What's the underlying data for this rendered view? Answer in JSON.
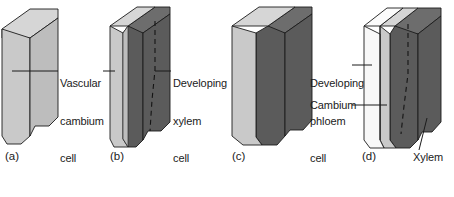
{
  "figure": {
    "background_color": "#ffffff",
    "panels": [
      {
        "id": "a",
        "caption": "(a)",
        "slabs": [
          {
            "name": "vascular-cambium-cell",
            "fill": "#c9c9c9",
            "top_fill": "#d6d6d6",
            "side_fill": "#bdbdbd"
          }
        ]
      },
      {
        "id": "b",
        "caption": "(b)",
        "slabs": [
          {
            "name": "vascular-cambium-cell",
            "fill": "#c9c9c9",
            "top_fill": "#d6d6d6",
            "side_fill": "#bdbdbd"
          },
          {
            "name": "developing-xylem-cell",
            "fill": "#5b5b5b",
            "top_fill": "#6d6d6d",
            "side_fill": "#515151"
          }
        ]
      },
      {
        "id": "c",
        "caption": "(c)",
        "slabs": [
          {
            "name": "vascular-cambium-cell",
            "fill": "#c9c9c9",
            "top_fill": "#d6d6d6",
            "side_fill": "#bdbdbd"
          },
          {
            "name": "xylem",
            "fill": "#5b5b5b",
            "top_fill": "#6d6d6d",
            "side_fill": "#515151"
          }
        ]
      },
      {
        "id": "d",
        "caption": "(d)",
        "slabs": [
          {
            "name": "developing-phloem-cell",
            "fill": "#f2f2f2",
            "top_fill": "#fbfbfb",
            "side_fill": "#e4e4e4"
          },
          {
            "name": "cambium",
            "fill": "#c9c9c9",
            "top_fill": "#d6d6d6",
            "side_fill": "#bdbdbd"
          },
          {
            "name": "xylem",
            "fill": "#5b5b5b",
            "top_fill": "#6d6d6d",
            "side_fill": "#515151"
          }
        ]
      }
    ],
    "labels": {
      "vascular_cambium_cell": "Vascular\ncambium\ncell",
      "vascular_cambium_cell_lines": [
        "Vascular",
        "cambium",
        "cell"
      ],
      "developing_xylem_cell": "Developing\nxylem\ncell",
      "developing_xylem_cell_lines": [
        "Developing",
        "xylem",
        "cell"
      ],
      "developing_phloem_cell": "Developing\nphloem\ncell",
      "developing_phloem_cell_lines": [
        "Developing",
        "phloem",
        "cell"
      ],
      "cambium": "Cambium",
      "xylem": "Xylem"
    },
    "captions": {
      "a": "(a)",
      "b": "(b)",
      "c": "(c)",
      "d": "(d)"
    },
    "colors": {
      "light_gray_face": "#c9c9c9",
      "light_gray_top": "#d6d6d6",
      "light_gray_side": "#bdbdbd",
      "dark_gray_face": "#5b5b5b",
      "dark_gray_top": "#6d6d6d",
      "dark_gray_side": "#515151",
      "white_face": "#f2f2f2",
      "white_top": "#fbfbfb",
      "white_side": "#e4e4e4",
      "outline": "#1b1b1b",
      "leader_line": "#1b1b1b",
      "dashed_line": "#101010",
      "text": "#1b1b1b"
    }
  }
}
